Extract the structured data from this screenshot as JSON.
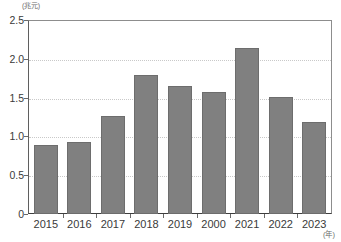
{
  "chart_data": {
    "type": "bar",
    "title": "",
    "xlabel": "(年)",
    "ylabel": "(兆元)",
    "categories": [
      "2015",
      "2016",
      "2017",
      "2018",
      "2019",
      "2000",
      "2021",
      "2022",
      "2023"
    ],
    "values": [
      0.89,
      0.93,
      1.27,
      1.8,
      1.66,
      1.58,
      2.15,
      1.51,
      1.19
    ],
    "ylim": [
      0,
      2.5
    ],
    "ytick_labels": [
      "0",
      "0.5",
      "1.0",
      "1.5",
      "2.0",
      "2.5"
    ],
    "ytick_values": [
      0,
      0.5,
      1.0,
      1.5,
      2.0,
      2.5
    ],
    "grid": true,
    "legend": "none",
    "bar_color": "#808080",
    "bar_border_color": "#6d6d6d",
    "grid_color": "#c9c9c9",
    "axis_color": "#3d3d3d",
    "text_color": "#3a3a3a"
  },
  "axis": {
    "y_unit_label": "(兆元)",
    "x_unit_label": "(年)"
  }
}
